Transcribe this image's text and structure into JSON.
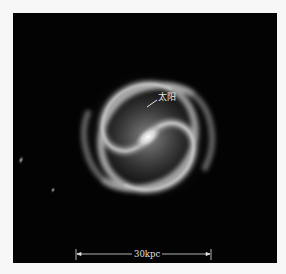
{
  "image": {
    "subject": "Milky Way spiral galaxy illustration (face-on view)",
    "background_color": "#030303",
    "frame_color": "#f7f7f7"
  },
  "annotations": {
    "sun_label": "太阳",
    "scale_bar_label": "30kpc"
  },
  "features": {
    "galaxy_center": [
      148,
      137
    ],
    "galaxy_radius_px": 62,
    "satellite_galaxies": 2
  }
}
